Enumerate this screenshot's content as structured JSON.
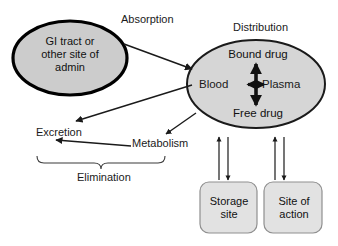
{
  "diagram": {
    "background_color": "#ffffff",
    "line_color": "#1a1a1a",
    "node_fill": "#d4d4d4",
    "box_fill": "#e2e2e2",
    "box_border": "#8f8f8f",
    "nodes": {
      "gi_tract": {
        "label": "GI tract or\nother site of\nadmin",
        "shape": "ellipse",
        "fill": "#cccccc",
        "border": "#000000"
      },
      "blood_compartment": {
        "shape": "ellipse",
        "fill": "#d6d6d6",
        "border": "#1a1a1a",
        "bound_drug": "Bound drug",
        "free_drug": "Free drug",
        "blood": "Blood",
        "plasma": "Plasma"
      },
      "storage_site": {
        "label": "Storage\nsite",
        "shape": "rounded-rect",
        "fill": "#e2e2e2"
      },
      "site_of_action": {
        "label": "Site of\naction",
        "shape": "rounded-rect",
        "fill": "#e2e2e2"
      }
    },
    "process_labels": {
      "absorption": "Absorption",
      "distribution": "Distribution",
      "excretion": "Excretion",
      "metabolism": "Metabolism",
      "elimination": "Elimination"
    }
  }
}
